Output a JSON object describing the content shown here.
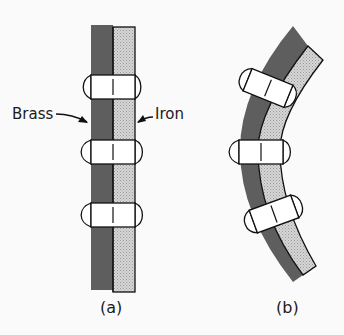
{
  "figure": {
    "panel_a": {
      "label": "(a)",
      "description": "Straight bimetallic strip riveted together",
      "brass_label": "Brass",
      "iron_label": "Iron",
      "rivet_count": 3
    },
    "panel_b": {
      "label": "(b)",
      "description": "Bimetallic strip bent after heating",
      "rivet_count": 3
    },
    "colors": {
      "brass": "#5e5e5e",
      "iron": "#cfcfcf",
      "outline": "#111111",
      "background": "#fafafa"
    }
  }
}
